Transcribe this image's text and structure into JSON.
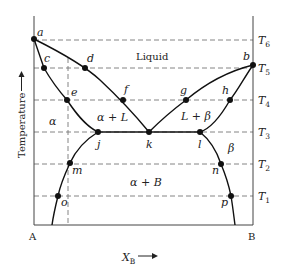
{
  "diagram": {
    "type": "binary eutectic phase diagram",
    "axes": {
      "y_label": "Temperature",
      "x_label": "X",
      "x_label_sub": "B",
      "left_component": "A",
      "right_component": "B"
    },
    "temperatures": [
      {
        "name": "T",
        "sub": "6"
      },
      {
        "name": "T",
        "sub": "5"
      },
      {
        "name": "T",
        "sub": "4"
      },
      {
        "name": "T",
        "sub": "3"
      },
      {
        "name": "T",
        "sub": "2"
      },
      {
        "name": "T",
        "sub": "1"
      }
    ],
    "regions": {
      "liquid": "Liquid",
      "alpha": "α",
      "alpha_plus_L": "α + L",
      "L_plus_beta": "L + β",
      "beta": "β",
      "alpha_plus_B": "α + B"
    },
    "points": {
      "a": "a",
      "b": "b",
      "c": "c",
      "d": "d",
      "e": "e",
      "f": "f",
      "g": "g",
      "h": "h",
      "j": "j",
      "k": "k",
      "l": "l",
      "m": "m",
      "n": "n",
      "o": "o",
      "p": "p"
    }
  }
}
